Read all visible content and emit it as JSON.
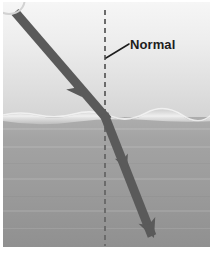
{
  "figure": {
    "canvas": {
      "width": 217,
      "height": 260
    },
    "photo_area": {
      "x": 3,
      "y": 2,
      "width": 207,
      "height": 245
    },
    "labels": {
      "normal": "Normal"
    },
    "colors": {
      "air_top": "#f2f2f2",
      "air_bottom": "#d6d6d6",
      "surface_highlight": "#eeeeee",
      "water_top": "#a8a8a8",
      "water_bottom": "#949494",
      "ray": "#5a5a5a",
      "normal_line": "#6e6e6e",
      "leader_line": "#1d1d1d",
      "label_text": "#1d1d1d",
      "page_background": "#ffffff",
      "corner_mark": "#d9d9d9"
    },
    "geometry": {
      "surface_y": 117,
      "normal_line_x": 105,
      "normal_line_top_y": 10,
      "normal_line_bottom_y": 246,
      "incident_start": {
        "x": 15,
        "y": 12
      },
      "interface_point": {
        "x": 106,
        "y": 118
      },
      "refracted_end": {
        "x": 152,
        "y": 235
      },
      "ray_width": 9,
      "leader_line_start": {
        "x": 128,
        "y": 45
      },
      "leader_line_end": {
        "x": 106,
        "y": 57
      },
      "arrowheads": [
        {
          "name": "incident-arrowhead",
          "x": 80,
          "y": 95,
          "angle": 49
        },
        {
          "name": "refracted-arrowhead-mid",
          "x": 126,
          "y": 168,
          "angle": 68
        },
        {
          "name": "refracted-arrowhead-end",
          "x": 149,
          "y": 228,
          "angle": 68
        }
      ]
    },
    "elements": {
      "air_region": "air-region",
      "water_region": "water-region",
      "surface_line": "water-surface-line",
      "normal_line": "normal-dashed-line",
      "incident_ray": "incident-light-ray",
      "refracted_ray": "refracted-light-ray",
      "corner_mark": "corner-circle-mark"
    }
  }
}
